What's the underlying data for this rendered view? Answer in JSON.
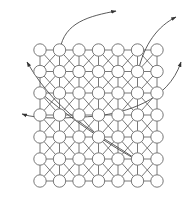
{
  "diagram": {
    "type": "lattice-grid-with-trajectories",
    "colors": {
      "background": "#ffffff",
      "edge": "#6a6a6a",
      "node_stroke": "#6a6a6a",
      "node_fill": "#ffffff",
      "curve": "#4a4a4a"
    },
    "grid": {
      "cols_x": [
        40,
        59.5,
        79,
        98.5,
        118,
        137.5,
        157
      ],
      "rows_y": [
        50,
        71.5,
        93,
        115,
        137,
        159,
        181
      ],
      "node_radius": 6.2,
      "diagonals": "alternating-x-pattern"
    },
    "curves": [
      {
        "name": "trajectory-top-left",
        "d": "M60 50 C64 22, 90 16, 116 11",
        "arrow": {
          "x": 118,
          "y": 10.5,
          "angle": -12
        }
      },
      {
        "name": "trajectory-top-right",
        "d": "M138 72 C144 44, 158 26, 176 17",
        "arrow": {
          "x": 178,
          "y": 16,
          "angle": -28
        }
      },
      {
        "name": "trajectory-right",
        "d": "M98 116 C125 112, 168 102, 181 62",
        "arrow": {
          "x": 182,
          "y": 59,
          "angle": -72
        }
      },
      {
        "name": "trajectory-left",
        "d": "M98 116 C70 118, 40 120, 22 114",
        "arrow": {
          "x": 19,
          "y": 113.5,
          "angle": 195
        }
      },
      {
        "name": "trajectory-diagonal",
        "d": "M137 160 C110 140, 60 120, 27 62",
        "arrow": {
          "x": 26,
          "y": 60,
          "angle": 240
        }
      },
      {
        "name": "trajectory-diagonal-2",
        "d": "M40 92 C60 110, 100 140, 137 160",
        "arrow": null
      }
    ]
  }
}
